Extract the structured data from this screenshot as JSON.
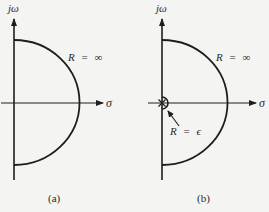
{
  "figures": [
    {
      "id": "a",
      "caption": "(a)",
      "imag_axis_label": "jω",
      "real_axis_label": "σ",
      "contour_label": "R = ∞",
      "contour_label_parts": {
        "var": "R",
        "eq": "=",
        "val": "∞"
      }
    },
    {
      "id": "b",
      "caption": "(b)",
      "imag_axis_label": "jω",
      "real_axis_label": "σ",
      "contour_label": "R = ∞",
      "contour_label_parts": {
        "var": "R",
        "eq": "=",
        "val": "∞"
      },
      "indent_label": "R = ϵ",
      "indent_label_parts": {
        "var": "R",
        "eq": "=",
        "val": "ϵ"
      },
      "pole_marker": "×"
    }
  ],
  "colors": {
    "background": "#f4f4f2",
    "stroke": "#1e1e1e",
    "text": "#2a2a2a"
  }
}
